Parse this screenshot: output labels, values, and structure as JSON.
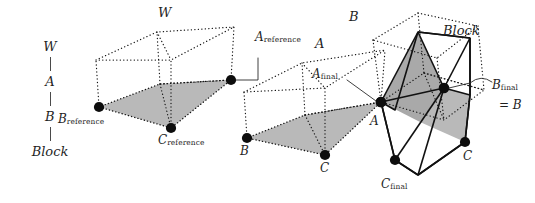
{
  "figure": {
    "type": "geometric-diagram",
    "background_color": "#ffffff",
    "shade_color": "#b9b9b9",
    "dot_color": "#111111",
    "line_color": "#1a1a1a"
  },
  "hierarchy_chain": {
    "name": "frame-hierarchy",
    "nodes": [
      {
        "label": "W",
        "style": "script"
      },
      {
        "label": "A",
        "style": "script"
      },
      {
        "label": "B",
        "style": "script"
      },
      {
        "label": "Block",
        "style": "italic"
      }
    ]
  },
  "frames": [
    {
      "id": "reference-frame",
      "frame_label": "W",
      "vertex_labels": [
        {
          "key": "A",
          "text": "A",
          "sub": "reference"
        },
        {
          "key": "B",
          "text": "B",
          "sub": "reference"
        },
        {
          "key": "C",
          "text": "C",
          "sub": "reference"
        }
      ]
    },
    {
      "id": "intermediate-frame",
      "frame_label": "A",
      "vertex_labels": [
        {
          "key": "A",
          "text": "A",
          "sub": "final"
        },
        {
          "key": "B",
          "text": "B",
          "sub": ""
        },
        {
          "key": "C",
          "text": "C",
          "sub": ""
        }
      ]
    },
    {
      "id": "final-frame",
      "frame_label": "B",
      "vertex_labels": [
        {
          "key": "A",
          "text": "A",
          "sub": ""
        },
        {
          "key": "B",
          "text": "B",
          "sub": "final"
        },
        {
          "key": "C",
          "text": "C",
          "sub": ""
        },
        {
          "key": "Cf",
          "text": "C",
          "sub": "final"
        }
      ]
    }
  ],
  "block": {
    "label": "Block",
    "equality": "= B"
  },
  "labels": {
    "chain_w": "W",
    "chain_a": "A",
    "chain_b": "B",
    "chain_block": "Block",
    "frame1_w": "W",
    "a_reference_base": "A",
    "a_reference_sub": "reference",
    "b_reference_base": "B",
    "b_reference_sub": "reference",
    "c_reference_base": "C",
    "c_reference_sub": "reference",
    "frame2_a": "A",
    "a_final_base": "A",
    "a_final_sub": "final",
    "frame2_b": "B",
    "frame2_c": "C",
    "frame3_b_script": "B",
    "block_label": "Block",
    "b_final_base": "B",
    "b_final_sub": "final",
    "equals_b": "= B",
    "frame3_a": "A",
    "frame3_c": "C",
    "c_final_base": "C",
    "c_final_sub": "final"
  }
}
